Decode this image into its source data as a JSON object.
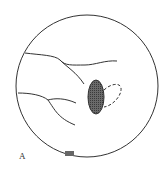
{
  "diagram": {
    "panel_label": "A",
    "colors": {
      "outline": "#333333",
      "fill_shaded": "#555555",
      "background": "#ffffff"
    },
    "elements": [
      {
        "type": "circle",
        "name": "outer-circle"
      },
      {
        "type": "curve",
        "name": "upper-vessel"
      },
      {
        "type": "curve",
        "name": "lower-vessel"
      },
      {
        "type": "ellipse",
        "name": "shaded-ellipse",
        "style": "stippled"
      },
      {
        "type": "ellipse",
        "name": "dashed-ellipse",
        "style": "dashed"
      }
    ]
  }
}
